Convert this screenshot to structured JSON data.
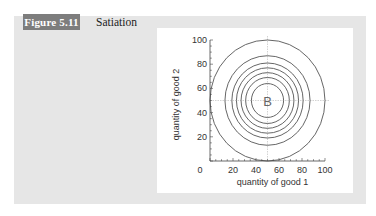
{
  "figure": {
    "badge": "Figure 5.11",
    "title": "Satiation"
  },
  "colors": {
    "panel_bg": "#e6e6e6",
    "badge_bg": "#7d7d7d",
    "badge_text": "#ffffff",
    "circle_stroke": "#555555",
    "crosshair": "#c8c8c8",
    "center_label": "#666666"
  },
  "chart_data": {
    "type": "line",
    "title": "Satiation",
    "xlabel": "quantity of good 1",
    "ylabel": "quantity of good 2",
    "xlim": [
      0,
      100
    ],
    "ylim": [
      0,
      100
    ],
    "xticks": [
      0,
      20,
      40,
      60,
      80,
      100
    ],
    "yticks": [
      20,
      40,
      60,
      80,
      100
    ],
    "xtick_labels": [
      "0",
      "20",
      "40",
      "60",
      "80",
      "100"
    ],
    "ytick_labels": [
      "20",
      "40",
      "60",
      "80",
      "100"
    ],
    "grid": false,
    "legend": null,
    "bliss_point": {
      "label": "B",
      "x": 50,
      "y": 50
    },
    "series": [
      {
        "name": "indifference curve 1",
        "shape": "circle",
        "center": [
          50,
          50
        ],
        "radius": 14
      },
      {
        "name": "indifference curve 2",
        "shape": "circle",
        "center": [
          50,
          50
        ],
        "radius": 19
      },
      {
        "name": "indifference curve 3",
        "shape": "circle",
        "center": [
          50,
          50
        ],
        "radius": 23
      },
      {
        "name": "indifference curve 4",
        "shape": "circle",
        "center": [
          50,
          50
        ],
        "radius": 27
      },
      {
        "name": "indifference curve 5",
        "shape": "circle",
        "center": [
          50,
          50
        ],
        "radius": 31
      },
      {
        "name": "indifference curve 6",
        "shape": "circle",
        "center": [
          50,
          50
        ],
        "radius": 37
      },
      {
        "name": "indifference curve 7",
        "shape": "circle",
        "center": [
          50,
          50
        ],
        "radius": 50
      }
    ],
    "crosshair": {
      "x": 50,
      "y": 50,
      "style": "dotted"
    }
  }
}
